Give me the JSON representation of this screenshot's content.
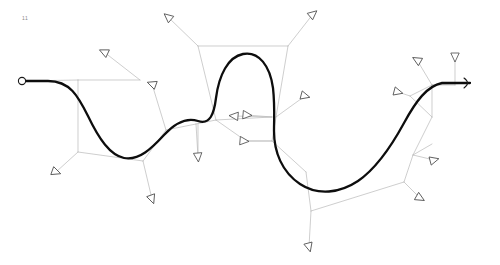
{
  "figure": {
    "corner_label": "11",
    "background_color": "#ffffff",
    "width": 500,
    "height": 265
  },
  "chart_data": {
    "type": "line",
    "title": "",
    "subtitle": "",
    "xlabel": "",
    "ylabel": "",
    "grid": false,
    "legend_position": "none",
    "xlim": [
      0,
      500
    ],
    "ylim": [
      0,
      265
    ],
    "series": [
      {
        "name": "spline-curve",
        "color": "#0d0d0d",
        "stroke_width": 2.3,
        "start_marker": "circle",
        "end_marker": "arrowhead",
        "path": "M 22 81 L 48 81 C 70 81 78 96 88 116 C 99 139 110 155 124 158 C 139 161 152 148 164 135 C 175 123 186 117 198 121 C 210 125 214 114 216 98 C 219 75 228 57 243 54 C 259 51 270 66 273 88 C 275 106 274 118 274 131 C 274 152 282 172 300 184 C 318 196 340 193 358 181 C 377 168 392 145 404 123 C 416 101 427 86 442 83 L 470 83",
        "points": [
          {
            "x": 22,
            "y": 81,
            "label": "start"
          },
          {
            "x": 124,
            "y": 158,
            "label": "trough-1"
          },
          {
            "x": 198,
            "y": 121,
            "label": "inflection-1"
          },
          {
            "x": 243,
            "y": 54,
            "label": "crest-1"
          },
          {
            "x": 340,
            "y": 193,
            "label": "trough-2"
          },
          {
            "x": 470,
            "y": 83,
            "label": "end"
          }
        ]
      }
    ],
    "mesh_edges": [
      [
        [
          78,
          80
        ],
        [
          22,
          81
        ]
      ],
      [
        [
          78,
          80
        ],
        [
          140,
          80
        ]
      ],
      [
        [
          140,
          80
        ],
        [
          104,
          52
        ]
      ],
      [
        [
          78,
          80
        ],
        [
          78,
          152
        ]
      ],
      [
        [
          78,
          152
        ],
        [
          56,
          172
        ]
      ],
      [
        [
          78,
          152
        ],
        [
          143,
          161
        ]
      ],
      [
        [
          143,
          161
        ],
        [
          152,
          199
        ]
      ],
      [
        [
          143,
          161
        ],
        [
          166,
          130
        ]
      ],
      [
        [
          166,
          130
        ],
        [
          152,
          84
        ]
      ],
      [
        [
          166,
          130
        ],
        [
          196,
          124
        ]
      ],
      [
        [
          196,
          124
        ],
        [
          198,
          157
        ]
      ],
      [
        [
          198,
          157
        ],
        [
          198,
          123
        ]
      ],
      [
        [
          196,
          124
        ],
        [
          216,
          120
        ]
      ],
      [
        [
          216,
          120
        ],
        [
          198,
          46
        ]
      ],
      [
        [
          198,
          46
        ],
        [
          168,
          17
        ]
      ],
      [
        [
          198,
          46
        ],
        [
          288,
          46
        ]
      ],
      [
        [
          288,
          46
        ],
        [
          313,
          14
        ]
      ],
      [
        [
          288,
          46
        ],
        [
          276,
          117
        ]
      ],
      [
        [
          276,
          117
        ],
        [
          305,
          96
        ]
      ],
      [
        [
          216,
          120
        ],
        [
          272,
          117
        ]
      ],
      [
        [
          272,
          117
        ],
        [
          247,
          115
        ]
      ],
      [
        [
          272,
          117
        ],
        [
          234,
          116
        ]
      ],
      [
        [
          216,
          120
        ],
        [
          246,
          141
        ]
      ],
      [
        [
          246,
          141
        ],
        [
          272,
          141
        ]
      ],
      [
        [
          272,
          141
        ],
        [
          244,
          141
        ]
      ],
      [
        [
          276,
          117
        ],
        [
          272,
          141
        ]
      ],
      [
        [
          272,
          141
        ],
        [
          306,
          172
        ]
      ],
      [
        [
          306,
          172
        ],
        [
          311,
          211
        ]
      ],
      [
        [
          311,
          211
        ],
        [
          309,
          247
        ]
      ],
      [
        [
          311,
          211
        ],
        [
          404,
          182
        ]
      ],
      [
        [
          404,
          182
        ],
        [
          413,
          155
        ]
      ],
      [
        [
          413,
          155
        ],
        [
          434,
          160
        ]
      ],
      [
        [
          413,
          155
        ],
        [
          432,
          144
        ]
      ],
      [
        [
          404,
          182
        ],
        [
          420,
          198
        ]
      ],
      [
        [
          413,
          155
        ],
        [
          432,
          117
        ]
      ],
      [
        [
          432,
          117
        ],
        [
          410,
          96
        ]
      ],
      [
        [
          410,
          96
        ],
        [
          398,
          92
        ]
      ],
      [
        [
          410,
          96
        ],
        [
          432,
          85
        ]
      ],
      [
        [
          432,
          85
        ],
        [
          417,
          60
        ]
      ],
      [
        [
          432,
          85
        ],
        [
          455,
          85
        ]
      ],
      [
        [
          455,
          85
        ],
        [
          455,
          57
        ]
      ],
      [
        [
          432,
          85
        ],
        [
          470,
          83
        ]
      ],
      [
        [
          432,
          117
        ],
        [
          432,
          85
        ]
      ]
    ],
    "triangle_markers": [
      {
        "x": 104,
        "y": 52,
        "rotation": 25,
        "label": "marker-1"
      },
      {
        "x": 56,
        "y": 172,
        "rotation": 200,
        "label": "marker-2"
      },
      {
        "x": 152,
        "y": 199,
        "rotation": 250,
        "label": "marker-3"
      },
      {
        "x": 152,
        "y": 84,
        "rotation": 20,
        "label": "marker-4"
      },
      {
        "x": 198,
        "y": 157,
        "rotation": 265,
        "label": "marker-5"
      },
      {
        "x": 168,
        "y": 17,
        "rotation": 40,
        "label": "marker-6"
      },
      {
        "x": 313,
        "y": 14,
        "rotation": 140,
        "label": "marker-7"
      },
      {
        "x": 305,
        "y": 96,
        "rotation": 195,
        "label": "marker-8"
      },
      {
        "x": 247,
        "y": 115,
        "rotation": 185,
        "label": "marker-9"
      },
      {
        "x": 234,
        "y": 116,
        "rotation": 5,
        "label": "marker-10"
      },
      {
        "x": 244,
        "y": 141,
        "rotation": 185,
        "label": "marker-11"
      },
      {
        "x": 309,
        "y": 247,
        "rotation": 255,
        "label": "marker-12"
      },
      {
        "x": 434,
        "y": 160,
        "rotation": 165,
        "label": "marker-13"
      },
      {
        "x": 420,
        "y": 198,
        "rotation": 210,
        "label": "marker-14"
      },
      {
        "x": 398,
        "y": 92,
        "rotation": 195,
        "label": "marker-15"
      },
      {
        "x": 417,
        "y": 60,
        "rotation": 30,
        "label": "marker-16"
      },
      {
        "x": 455,
        "y": 57,
        "rotation": 270,
        "label": "marker-17"
      }
    ]
  }
}
